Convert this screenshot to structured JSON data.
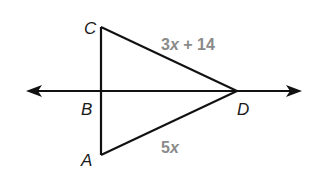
{
  "diagram": {
    "type": "triangle-with-line",
    "colors": {
      "stroke": "#111111",
      "point_label": "#1a1a1a",
      "length_label": "#8a8a8a",
      "background": "#ffffff"
    },
    "points": {
      "C": {
        "label": "C",
        "x": 101,
        "y": 27
      },
      "B": {
        "label": "B",
        "x": 101,
        "y": 91
      },
      "A": {
        "label": "A",
        "x": 101,
        "y": 155
      },
      "D": {
        "label": "D",
        "x": 237,
        "y": 91
      }
    },
    "segments": [
      {
        "from": "C",
        "to": "A"
      },
      {
        "from": "C",
        "to": "D"
      },
      {
        "from": "A",
        "to": "D"
      }
    ],
    "line": {
      "name": "line-BD",
      "through": [
        "B",
        "D"
      ],
      "arrows": "both"
    },
    "lengths": {
      "CD": {
        "coef": "3",
        "var": "x",
        "rest": " + 14"
      },
      "AD": {
        "coef": "5",
        "var": "x",
        "rest": ""
      }
    }
  }
}
